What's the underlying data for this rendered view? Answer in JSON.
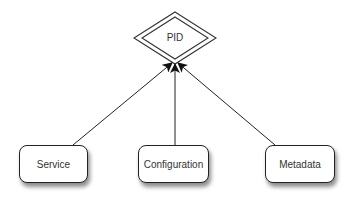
{
  "diagram": {
    "type": "entity-relationship",
    "central_node": {
      "label": "PID",
      "shape": "double-diamond"
    },
    "nodes": [
      {
        "label": "Service",
        "shape": "rounded-rectangle"
      },
      {
        "label": "Configuration",
        "shape": "rounded-rectangle"
      },
      {
        "label": "Metadata",
        "shape": "rounded-rectangle"
      }
    ],
    "edges": [
      {
        "from": "Service",
        "to": "PID",
        "arrow": "filled"
      },
      {
        "from": "Configuration",
        "to": "PID",
        "arrow": "filled"
      },
      {
        "from": "Metadata",
        "to": "PID",
        "arrow": "filled"
      }
    ],
    "colors": {
      "stroke": "#222222",
      "text": "#333333",
      "background": "#ffffff"
    }
  }
}
